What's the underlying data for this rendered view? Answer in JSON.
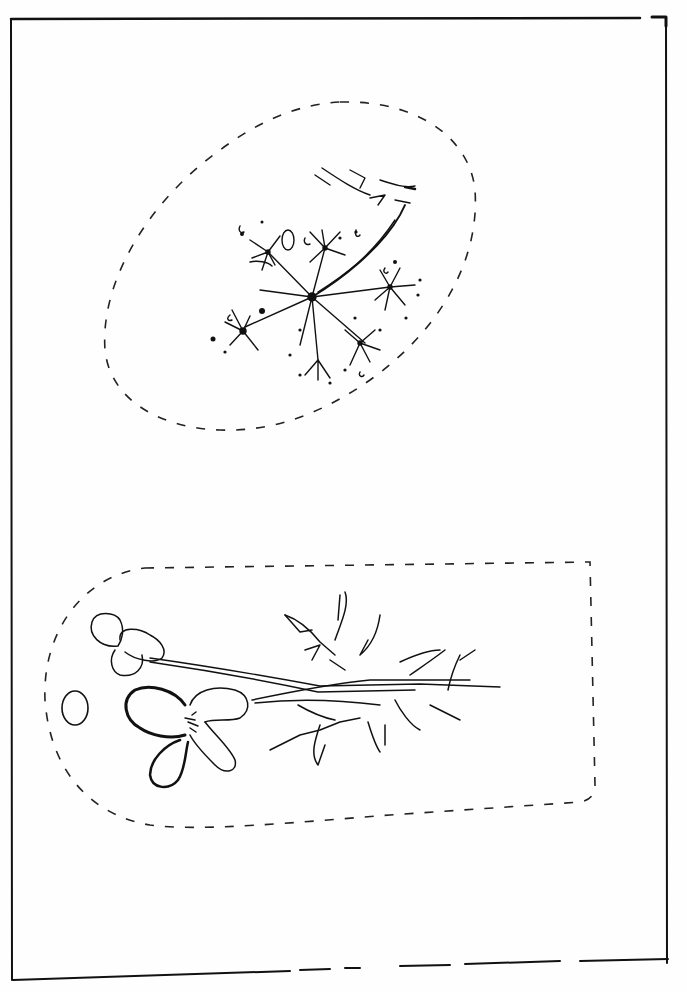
{
  "illustration": {
    "subject": "botanical line drawing",
    "style": "pen and ink, black on white",
    "colors": {
      "ink": "#111111",
      "paper": "#fefefe"
    },
    "panels": [
      {
        "name": "umbel-flower",
        "outline": "dashed egg shape"
      },
      {
        "name": "flowering-sprig",
        "outline": "dashed rounded tag shape with hole"
      }
    ]
  }
}
